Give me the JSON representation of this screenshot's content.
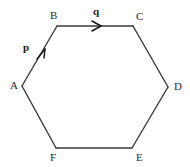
{
  "figure": {
    "type": "geometry-diagram",
    "shape": "hexagon",
    "background_color": "#ffffff",
    "line_color": "#3a3a3a",
    "text_color": "#2b2b2b",
    "width": 190,
    "height": 167
  },
  "vertices": [
    {
      "id": "A",
      "label": "A",
      "x": 22,
      "y": 86
    },
    {
      "id": "B",
      "label": "B",
      "x": 57,
      "y": 26
    },
    {
      "id": "C",
      "label": "C",
      "x": 133,
      "y": 26
    },
    {
      "id": "D",
      "label": "D",
      "x": 168,
      "y": 87
    },
    {
      "id": "E",
      "label": "E",
      "x": 132,
      "y": 148
    },
    {
      "id": "F",
      "label": "F",
      "x": 56,
      "y": 148
    }
  ],
  "edges": [
    {
      "from": "A",
      "to": "B"
    },
    {
      "from": "B",
      "to": "C"
    },
    {
      "from": "C",
      "to": "D"
    },
    {
      "from": "D",
      "to": "E"
    },
    {
      "from": "E",
      "to": "F"
    },
    {
      "from": "F",
      "to": "A"
    }
  ],
  "vectors": [
    {
      "id": "p",
      "label": "p",
      "from": "A",
      "to": "B",
      "arrow_x": 43,
      "arrow_y": 54
    },
    {
      "id": "q",
      "label": "q",
      "from": "B",
      "to": "C",
      "arrow_x": 99,
      "arrow_y": 26
    }
  ]
}
